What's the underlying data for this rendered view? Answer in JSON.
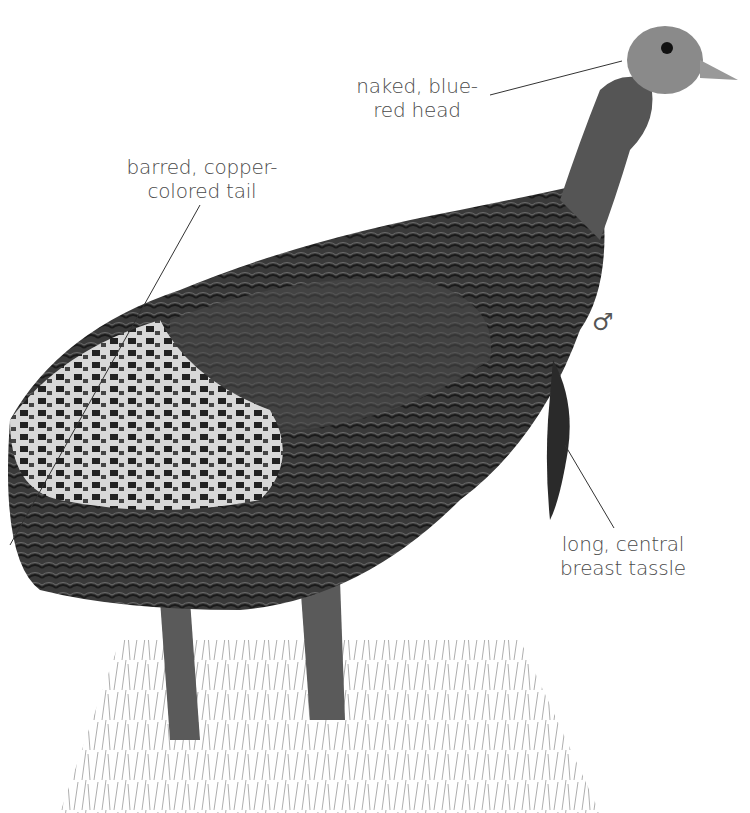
{
  "figure": {
    "sex_symbol": "♂",
    "labels": [
      {
        "id": "head",
        "lines": [
          "naked, blue-",
          "red head"
        ]
      },
      {
        "id": "tail",
        "lines": [
          "barred, copper-",
          "colored tail"
        ]
      },
      {
        "id": "tassle",
        "lines": [
          "long, central",
          "breast tassle"
        ]
      }
    ]
  }
}
